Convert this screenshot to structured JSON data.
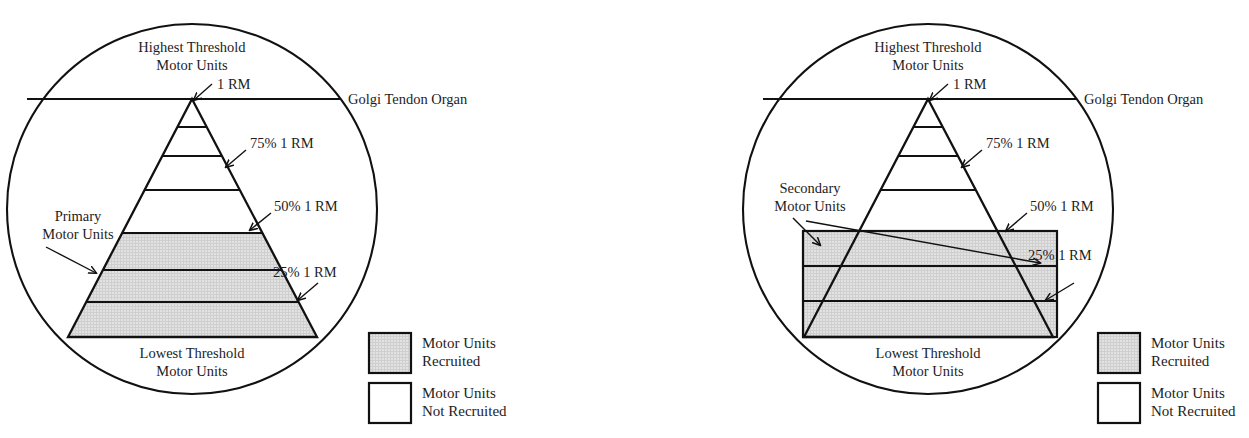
{
  "figure": {
    "panels": [
      {
        "id": "left",
        "name": "primary-motor-units-panel",
        "labels": {
          "top": {
            "line1": "Highest Threshold",
            "line2": "Motor Units"
          },
          "bottom": {
            "line1": "Lowest Threshold",
            "line2": "Motor Units"
          },
          "golgi": "Golgi Tendon Organ",
          "callout": {
            "line1": "Primary",
            "line2": "Motor Units"
          }
        },
        "intensity_marks": [
          {
            "label": "1 RM",
            "value": 100
          },
          {
            "label": "75% 1 RM",
            "value": 75
          },
          {
            "label": "50% 1 RM",
            "value": 50
          },
          {
            "label": "25% 1 RM",
            "value": 25
          }
        ],
        "recruited_bands": 3,
        "total_bands": 7,
        "recruited_shape": "triangle-lower-section"
      },
      {
        "id": "right",
        "name": "secondary-motor-units-panel",
        "labels": {
          "top": {
            "line1": "Highest Threshold",
            "line2": "Motor Units"
          },
          "bottom": {
            "line1": "Lowest Threshold",
            "line2": "Motor Units"
          },
          "golgi": "Golgi Tendon Organ",
          "callout": {
            "line1": "Secondary",
            "line2": "Motor Units"
          }
        },
        "intensity_marks": [
          {
            "label": "1 RM",
            "value": 100
          },
          {
            "label": "75% 1 RM",
            "value": 75
          },
          {
            "label": "50% 1 RM",
            "value": 50
          },
          {
            "label": "25% 1 RM",
            "value": 25
          }
        ],
        "recruited_bands": 3,
        "total_bands": 7,
        "recruited_shape": "rectangle-full-width"
      }
    ],
    "legend": {
      "name": "recruitment-legend",
      "entries": [
        {
          "swatch": "shaded",
          "line1": "Motor Units",
          "line2": "Recruited"
        },
        {
          "swatch": "empty",
          "line1": "Motor Units",
          "line2": "Not Recruited"
        }
      ]
    },
    "colors": {
      "ink": "#111111",
      "shade_fill": "#dcdcdc",
      "background": "#ffffff"
    }
  }
}
